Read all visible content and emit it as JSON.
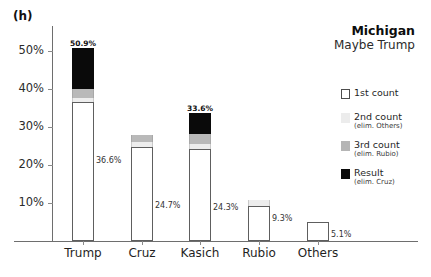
{
  "panel": {
    "label": "(h)"
  },
  "title": {
    "main": "Michigan",
    "sub": "Maybe Trump"
  },
  "legend": {
    "items": [
      {
        "name": "1st count",
        "sub": "",
        "color": "#ffffff",
        "swatch_class": "sw-first"
      },
      {
        "name": "2nd count",
        "sub": "(elim. Others)",
        "color": "#ececec",
        "swatch_class": "sw-second"
      },
      {
        "name": "3rd count",
        "sub": "(elim. Rubio)",
        "color": "#b5b5b5",
        "swatch_class": "sw-third"
      },
      {
        "name": "Result",
        "sub": "(elim. Cruz)",
        "color": "#0a0a0a",
        "swatch_class": "sw-result"
      }
    ]
  },
  "axes": {
    "y_ticks": [
      "10%",
      "20%",
      "30%",
      "40%",
      "50%"
    ],
    "y_values": [
      10,
      20,
      30,
      40,
      50
    ],
    "y_label": "",
    "x_label": "",
    "ymin": 0,
    "ymax": 55
  },
  "chart_data": {
    "type": "bar",
    "title": "Michigan",
    "subtitle": "Maybe Trump",
    "panel": "(h)",
    "xlabel": "",
    "ylabel": "",
    "ylim": [
      0,
      55
    ],
    "grid": false,
    "legend_position": "right",
    "stacked": true,
    "categories": [
      "Trump",
      "Cruz",
      "Kasich",
      "Rubio",
      "Others"
    ],
    "series": [
      {
        "name": "1st count",
        "note": "",
        "values": [
          36.6,
          24.7,
          24.3,
          9.3,
          5.1
        ]
      },
      {
        "name": "2nd count",
        "note": "(elim. Others)",
        "values": [
          37.7,
          26.1,
          25.5,
          10.7,
          null
        ]
      },
      {
        "name": "3rd count",
        "note": "(elim. Rubio)",
        "values": [
          39.9,
          27.8,
          28.2,
          null,
          null
        ]
      },
      {
        "name": "Result",
        "note": "(elim. Cruz)",
        "values": [
          50.9,
          null,
          33.6,
          null,
          null
        ]
      }
    ],
    "bar_top_labels": [
      "50.9%",
      "",
      "33.6%",
      "",
      ""
    ],
    "bar_inline_labels": [
      "36.6%",
      "24.7%",
      "24.3%",
      "9.3%",
      "5.1%"
    ]
  },
  "bars": [
    {
      "category": "Trump",
      "center_x": 83,
      "width": 22,
      "first": 36.6,
      "second": 37.7,
      "third": 39.9,
      "result": 50.9,
      "top_label": "50.9%",
      "inline_label": "36.6%"
    },
    {
      "category": "Cruz",
      "center_x": 142,
      "width": 22,
      "first": 24.7,
      "second": 26.1,
      "third": 27.8,
      "result": null,
      "top_label": "",
      "inline_label": "24.7%"
    },
    {
      "category": "Kasich",
      "center_x": 200,
      "width": 22,
      "first": 24.3,
      "second": 25.5,
      "third": 28.2,
      "result": 33.6,
      "top_label": "33.6%",
      "inline_label": "24.3%"
    },
    {
      "category": "Rubio",
      "center_x": 259,
      "width": 22,
      "first": 9.3,
      "second": 10.7,
      "third": null,
      "result": null,
      "top_label": "",
      "inline_label": "9.3%"
    },
    {
      "category": "Others",
      "center_x": 318,
      "width": 22,
      "first": 5.1,
      "second": null,
      "third": null,
      "result": null,
      "top_label": "",
      "inline_label": "5.1%"
    }
  ]
}
